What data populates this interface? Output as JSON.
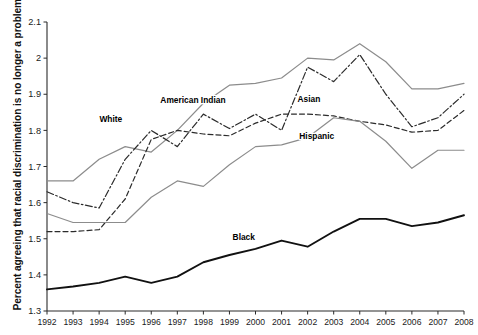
{
  "chart_data": {
    "type": "line",
    "title": "",
    "xlabel": "",
    "ylabel": "Percent agreeing that racial discrimination is no longer a problem",
    "x": [
      1992,
      1993,
      1994,
      1995,
      1996,
      1997,
      1998,
      1999,
      2000,
      2001,
      2002,
      2003,
      2004,
      2005,
      2006,
      2007,
      2008
    ],
    "xtick_labels": [
      "1992",
      "1993",
      "1994",
      "1995",
      "1996",
      "1997",
      "1998",
      "1999",
      "2000",
      "2001",
      "2002",
      "2003",
      "2004",
      "2005",
      "2006",
      "2007",
      "2008"
    ],
    "ylim": [
      1.3,
      2.1
    ],
    "ytick_labels": [
      "2.1",
      "2",
      "1.9",
      "1.8",
      "1.7",
      "1.6",
      "1.5",
      "1.4",
      "1.3"
    ],
    "ytick_values": [
      2.1,
      2.0,
      1.9,
      1.8,
      1.7,
      1.6,
      1.5,
      1.4,
      1.3
    ],
    "grid": false,
    "legend_position": "inline-annotations",
    "series": [
      {
        "name": "White",
        "style": "solid",
        "color": "#8c8c8c",
        "width": 1.2,
        "label_x": 1994.45,
        "label_y": 1.823,
        "values": [
          1.66,
          1.66,
          1.72,
          1.755,
          1.74,
          1.8,
          1.875,
          1.925,
          1.93,
          1.945,
          2.0,
          1.995,
          2.04,
          1.99,
          1.915,
          1.915,
          1.93
        ]
      },
      {
        "name": "American Indian",
        "style": "dashdot",
        "color": "#2b2b2b",
        "width": 1.2,
        "label_x": 1997.6,
        "label_y": 1.875,
        "values": [
          1.63,
          1.6,
          1.585,
          1.72,
          1.8,
          1.755,
          1.845,
          1.805,
          1.845,
          1.8,
          1.975,
          1.935,
          2.01,
          1.9,
          1.81,
          1.835,
          1.9
        ]
      },
      {
        "name": "Asian",
        "style": "dashed",
        "color": "#2b2b2b",
        "width": 1.2,
        "label_x": 2002.05,
        "label_y": 1.878,
        "values": [
          1.52,
          1.52,
          1.525,
          1.61,
          1.775,
          1.8,
          1.79,
          1.785,
          1.82,
          1.845,
          1.845,
          1.84,
          1.825,
          1.815,
          1.795,
          1.8,
          1.855
        ]
      },
      {
        "name": "Hispanic",
        "style": "solid",
        "color": "#8c8c8c",
        "width": 1.2,
        "label_x": 2002.35,
        "label_y": 1.775,
        "values": [
          1.57,
          1.545,
          1.545,
          1.545,
          1.615,
          1.66,
          1.645,
          1.705,
          1.755,
          1.76,
          1.78,
          1.835,
          1.825,
          1.77,
          1.695,
          1.745,
          1.745
        ]
      },
      {
        "name": "Black",
        "style": "solid",
        "color": "#111111",
        "width": 1.9,
        "label_x": 1999.55,
        "label_y": 1.497,
        "values": [
          1.36,
          1.368,
          1.378,
          1.395,
          1.378,
          1.395,
          1.435,
          1.455,
          1.472,
          1.495,
          1.478,
          1.52,
          1.555,
          1.555,
          1.535,
          1.545,
          1.565
        ]
      }
    ]
  }
}
